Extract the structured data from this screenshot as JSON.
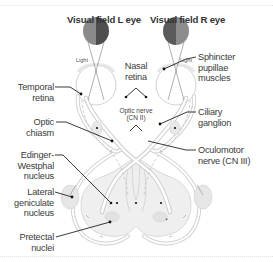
{
  "titles": {
    "left_eye": "Visual field L eye",
    "right_eye": "Visual field R eye"
  },
  "eye_labels": {
    "light_left": "Light",
    "light_right": "Light"
  },
  "center_labels": {
    "nasal_retina_1": "Nasal",
    "nasal_retina_2": "retina",
    "optic_nerve_1": "Optic nerve",
    "optic_nerve_2": "(CN II)"
  },
  "left_labels": {
    "temporal_retina_1": "Temporal",
    "temporal_retina_2": "retina",
    "optic_chiasm_1": "Optic",
    "optic_chiasm_2": "chiasm",
    "edinger_1": "Edinger-",
    "edinger_2": "Westphal",
    "edinger_3": "nucleus",
    "lgn_1": "Lateral",
    "lgn_2": "geniculate",
    "lgn_3": "nucleus",
    "pretectal_1": "Pretectal",
    "pretectal_2": "nuclei"
  },
  "right_labels": {
    "sphincter_1": "Sphincter",
    "sphincter_2": "pupillae",
    "sphincter_3": "muscles",
    "ciliary_1": "Ciliary",
    "ciliary_2": "ganglion",
    "oculomotor_1": "Oculomotor",
    "oculomotor_2": "nerve (CN III)"
  },
  "colors": {
    "visual_field_dark": "#5a5a5a",
    "visual_field_mid": "#8a8a8a",
    "structure_fill": "#ececec",
    "structure_stroke": "#c8c8c8",
    "leader": "#222222"
  }
}
